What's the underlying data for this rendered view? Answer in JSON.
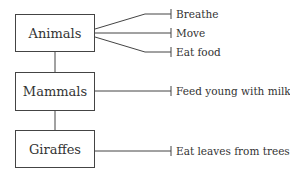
{
  "diagram": {
    "type": "classification-tree",
    "nodes": [
      {
        "id": "animals",
        "label": "Animals",
        "properties": [
          "Breathe",
          "Move",
          "Eat food"
        ]
      },
      {
        "id": "mammals",
        "label": "Mammals",
        "properties": [
          "Feed young with milk"
        ]
      },
      {
        "id": "giraffes",
        "label": "Giraffes",
        "properties": [
          "Eat leaves from trees"
        ]
      }
    ],
    "edges": [
      {
        "from": "animals",
        "to": "mammals"
      },
      {
        "from": "mammals",
        "to": "giraffes"
      }
    ]
  },
  "colors": {
    "line": "#444444",
    "text": "#333333",
    "background": "#ffffff"
  }
}
